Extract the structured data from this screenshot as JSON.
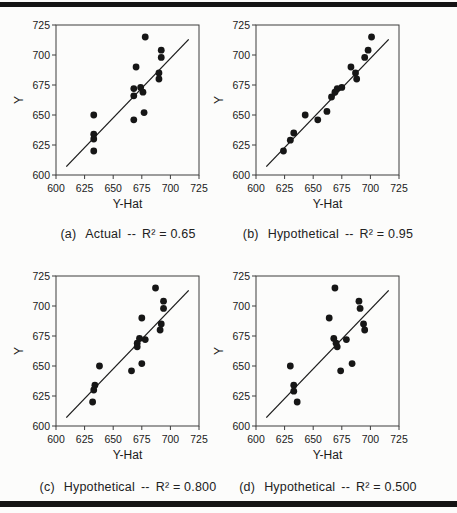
{
  "figure": {
    "background": "#fcfcfb",
    "rule_color": "#141414",
    "dot_color": "#161616",
    "line_color": "#1c1c1c",
    "frame_color": "#3c3c3c"
  },
  "axes": {
    "x_label": "Y-Hat",
    "y_label": "Y",
    "tick_values": [
      600,
      625,
      650,
      675,
      700,
      725
    ]
  },
  "chart_data": [
    {
      "id": "a",
      "type": "scatter",
      "caption": {
        "prefix": "(a)",
        "title": "Actual",
        "dashes": "--",
        "r2": "R² = 0.65"
      },
      "xlabel": "Y-Hat",
      "ylabel": "Y",
      "xlim": [
        600,
        725
      ],
      "ylim": [
        600,
        725
      ],
      "x_ticks": [
        600,
        625,
        650,
        675,
        700,
        725
      ],
      "y_ticks": [
        600,
        625,
        650,
        675,
        700,
        725
      ],
      "fit_line": {
        "x1": 609,
        "y1": 607,
        "x2": 716,
        "y2": 713
      },
      "points": [
        [
          633,
          650
        ],
        [
          633,
          634
        ],
        [
          633,
          630
        ],
        [
          633,
          620
        ],
        [
          670,
          690
        ],
        [
          668,
          672
        ],
        [
          668,
          666
        ],
        [
          674,
          673
        ],
        [
          676,
          669
        ],
        [
          677,
          652
        ],
        [
          668,
          646
        ],
        [
          678,
          715
        ],
        [
          692,
          704
        ],
        [
          692,
          698
        ],
        [
          690,
          685
        ],
        [
          690,
          680
        ]
      ]
    },
    {
      "id": "b",
      "type": "scatter",
      "caption": {
        "prefix": "(b)",
        "title": "Hypothetical",
        "dashes": "--",
        "r2": "R² = 0.95"
      },
      "xlabel": "Y-Hat",
      "ylabel": "Y",
      "xlim": [
        600,
        725
      ],
      "ylim": [
        600,
        725
      ],
      "x_ticks": [
        600,
        625,
        650,
        675,
        700,
        725
      ],
      "y_ticks": [
        600,
        625,
        650,
        675,
        700,
        725
      ],
      "fit_line": {
        "x1": 609,
        "y1": 607,
        "x2": 716,
        "y2": 713
      },
      "points": [
        [
          624,
          620
        ],
        [
          630,
          629
        ],
        [
          633,
          635
        ],
        [
          643,
          650
        ],
        [
          654,
          646
        ],
        [
          662,
          653
        ],
        [
          666,
          665
        ],
        [
          669,
          669
        ],
        [
          671,
          672
        ],
        [
          675,
          673
        ],
        [
          683,
          690
        ],
        [
          687,
          685
        ],
        [
          688,
          680
        ],
        [
          695,
          698
        ],
        [
          698,
          704
        ],
        [
          701,
          715
        ]
      ]
    },
    {
      "id": "c",
      "type": "scatter",
      "caption": {
        "prefix": "(c)",
        "title": "Hypothetical",
        "dashes": "--",
        "r2": "R² = 0.800"
      },
      "xlabel": "Y-Hat",
      "ylabel": "Y",
      "xlim": [
        600,
        725
      ],
      "ylim": [
        600,
        725
      ],
      "x_ticks": [
        600,
        625,
        650,
        675,
        700,
        725
      ],
      "y_ticks": [
        600,
        625,
        650,
        675,
        700,
        725
      ],
      "fit_line": {
        "x1": 609,
        "y1": 607,
        "x2": 716,
        "y2": 713
      },
      "points": [
        [
          638,
          650
        ],
        [
          634,
          634
        ],
        [
          633,
          630
        ],
        [
          632,
          620
        ],
        [
          666,
          646
        ],
        [
          675,
          652
        ],
        [
          671,
          669
        ],
        [
          671,
          666
        ],
        [
          673,
          673
        ],
        [
          678,
          672
        ],
        [
          675,
          690
        ],
        [
          687,
          715
        ],
        [
          694,
          704
        ],
        [
          694,
          698
        ],
        [
          692,
          685
        ],
        [
          691,
          680
        ]
      ]
    },
    {
      "id": "d",
      "type": "scatter",
      "caption": {
        "prefix": "(d)",
        "title": "Hypothetical",
        "dashes": "--",
        "r2": "R² = 0.500"
      },
      "xlabel": "Y-Hat",
      "ylabel": "Y",
      "xlim": [
        600,
        725
      ],
      "ylim": [
        600,
        725
      ],
      "x_ticks": [
        600,
        625,
        650,
        675,
        700,
        725
      ],
      "y_ticks": [
        600,
        625,
        650,
        675,
        700,
        725
      ],
      "fit_line": {
        "x1": 609,
        "y1": 607,
        "x2": 716,
        "y2": 713
      },
      "points": [
        [
          630,
          650
        ],
        [
          633,
          634
        ],
        [
          633,
          629
        ],
        [
          636,
          620
        ],
        [
          664,
          690
        ],
        [
          668,
          673
        ],
        [
          670,
          669
        ],
        [
          671,
          666
        ],
        [
          679,
          672
        ],
        [
          684,
          652
        ],
        [
          674,
          646
        ],
        [
          669,
          715
        ],
        [
          690,
          704
        ],
        [
          691,
          698
        ],
        [
          694,
          685
        ],
        [
          695,
          680
        ]
      ]
    }
  ]
}
